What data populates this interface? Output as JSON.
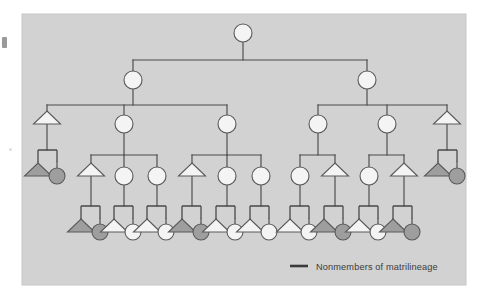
{
  "figure": {
    "type": "kinship-diagram",
    "title": "",
    "panel": {
      "background_color": "#d2d2d2",
      "border_color": "#c3c3c3",
      "x": 22,
      "y": 14,
      "width": 444,
      "height": 271
    },
    "line_color": "#4a4a4a",
    "shape_stroke_color": "#5a5a5a",
    "fill_member_color": "#f4f4f4",
    "fill_nonmember_color": "#9e9e9e",
    "symbol_legend": {
      "circle": "female",
      "triangle": "male",
      "square": "marriage-union-node"
    }
  },
  "legend": {
    "marker": "line-swatch",
    "label": "Nonmembers of matrilineage",
    "x": 290,
    "y": 266,
    "swatch": {
      "x1": 290,
      "x2": 308,
      "y": 266,
      "color": "#3a3a3a",
      "width": 2.6
    }
  },
  "chart_data": {
    "type": "diagram",
    "generations": 5,
    "nodes": [
      {
        "id": "g1-f1",
        "gen": 1,
        "shape": "circle",
        "fill": "member",
        "x": 243,
        "y": 33,
        "r": 9
      },
      {
        "id": "g2-f1",
        "gen": 2,
        "shape": "circle",
        "fill": "member",
        "x": 133,
        "y": 80,
        "r": 9
      },
      {
        "id": "g2-f2",
        "gen": 2,
        "shape": "circle",
        "fill": "member",
        "x": 367,
        "y": 80,
        "r": 9
      },
      {
        "id": "g3-m1",
        "gen": 3,
        "shape": "triangle",
        "fill": "member",
        "x": 47,
        "y": 124
      },
      {
        "id": "g3-f1",
        "gen": 3,
        "shape": "circle",
        "fill": "member",
        "x": 124,
        "y": 124,
        "r": 9
      },
      {
        "id": "g3-f2",
        "gen": 3,
        "shape": "circle",
        "fill": "member",
        "x": 227,
        "y": 124,
        "r": 9
      },
      {
        "id": "g3-f3",
        "gen": 3,
        "shape": "circle",
        "fill": "member",
        "x": 318,
        "y": 124,
        "r": 9
      },
      {
        "id": "g3-f4",
        "gen": 3,
        "shape": "circle",
        "fill": "member",
        "x": 387,
        "y": 124,
        "r": 9
      },
      {
        "id": "g3-m2",
        "gen": 3,
        "shape": "triangle",
        "fill": "member",
        "x": 447,
        "y": 124
      },
      {
        "id": "g4-sp1a",
        "gen": 4,
        "shape": "triangle",
        "fill": "nonmember",
        "x": 38,
        "y": 176
      },
      {
        "id": "g4-sp1b",
        "gen": 4,
        "shape": "circle",
        "fill": "nonmember",
        "x": 57,
        "y": 176,
        "r": 8
      },
      {
        "id": "g4-m1",
        "gen": 4,
        "shape": "triangle",
        "fill": "member",
        "x": 91,
        "y": 176
      },
      {
        "id": "g4-f1",
        "gen": 4,
        "shape": "circle",
        "fill": "member",
        "x": 124,
        "y": 176,
        "r": 9
      },
      {
        "id": "g4-f2",
        "gen": 4,
        "shape": "circle",
        "fill": "member",
        "x": 157,
        "y": 176,
        "r": 9
      },
      {
        "id": "g4-m2",
        "gen": 4,
        "shape": "triangle",
        "fill": "member",
        "x": 192,
        "y": 176
      },
      {
        "id": "g4-f3",
        "gen": 4,
        "shape": "circle",
        "fill": "member",
        "x": 227,
        "y": 176,
        "r": 9
      },
      {
        "id": "g4-f4",
        "gen": 4,
        "shape": "circle",
        "fill": "member",
        "x": 261,
        "y": 176,
        "r": 9
      },
      {
        "id": "g4-f5",
        "gen": 4,
        "shape": "circle",
        "fill": "member",
        "x": 300,
        "y": 176,
        "r": 9
      },
      {
        "id": "g4-m3",
        "gen": 4,
        "shape": "triangle",
        "fill": "member",
        "x": 335,
        "y": 176
      },
      {
        "id": "g4-f6",
        "gen": 4,
        "shape": "circle",
        "fill": "member",
        "x": 369,
        "y": 176,
        "r": 9
      },
      {
        "id": "g4-m4",
        "gen": 4,
        "shape": "triangle",
        "fill": "member",
        "x": 404,
        "y": 176
      },
      {
        "id": "g4-sp2a",
        "gen": 4,
        "shape": "triangle",
        "fill": "nonmember",
        "x": 438,
        "y": 176
      },
      {
        "id": "g4-sp2b",
        "gen": 4,
        "shape": "circle",
        "fill": "nonmember",
        "x": 457,
        "y": 176,
        "r": 8
      },
      {
        "id": "g5-p1t",
        "gen": 5,
        "shape": "triangle",
        "fill": "nonmember",
        "x": 81,
        "y": 232
      },
      {
        "id": "g5-p1c",
        "gen": 5,
        "shape": "circle",
        "fill": "nonmember",
        "x": 100,
        "y": 232,
        "r": 8
      },
      {
        "id": "g5-p2t",
        "gen": 5,
        "shape": "triangle",
        "fill": "member",
        "x": 114,
        "y": 232
      },
      {
        "id": "g5-p2c",
        "gen": 5,
        "shape": "circle",
        "fill": "member",
        "x": 133,
        "y": 232,
        "r": 8
      },
      {
        "id": "g5-p3t",
        "gen": 5,
        "shape": "triangle",
        "fill": "member",
        "x": 147,
        "y": 232
      },
      {
        "id": "g5-p3c",
        "gen": 5,
        "shape": "circle",
        "fill": "member",
        "x": 166,
        "y": 232,
        "r": 8
      },
      {
        "id": "g5-p4t",
        "gen": 5,
        "shape": "triangle",
        "fill": "nonmember",
        "x": 182,
        "y": 232
      },
      {
        "id": "g5-p4c",
        "gen": 5,
        "shape": "circle",
        "fill": "nonmember",
        "x": 201,
        "y": 232,
        "r": 8
      },
      {
        "id": "g5-p5t",
        "gen": 5,
        "shape": "triangle",
        "fill": "member",
        "x": 216,
        "y": 232
      },
      {
        "id": "g5-p5c",
        "gen": 5,
        "shape": "circle",
        "fill": "member",
        "x": 235,
        "y": 232,
        "r": 8
      },
      {
        "id": "g5-p6t",
        "gen": 5,
        "shape": "triangle",
        "fill": "member",
        "x": 250,
        "y": 232
      },
      {
        "id": "g5-p6c",
        "gen": 5,
        "shape": "circle",
        "fill": "member",
        "x": 269,
        "y": 232,
        "r": 8
      },
      {
        "id": "g5-p7t",
        "gen": 5,
        "shape": "triangle",
        "fill": "member",
        "x": 290,
        "y": 232
      },
      {
        "id": "g5-p7c",
        "gen": 5,
        "shape": "circle",
        "fill": "member",
        "x": 309,
        "y": 232,
        "r": 8
      },
      {
        "id": "g5-p8t",
        "gen": 5,
        "shape": "triangle",
        "fill": "nonmember",
        "x": 324,
        "y": 232
      },
      {
        "id": "g5-p8c",
        "gen": 5,
        "shape": "circle",
        "fill": "nonmember",
        "x": 343,
        "y": 232,
        "r": 8
      },
      {
        "id": "g5-p9t",
        "gen": 5,
        "shape": "triangle",
        "fill": "member",
        "x": 359,
        "y": 232
      },
      {
        "id": "g5-p9c",
        "gen": 5,
        "shape": "circle",
        "fill": "member",
        "x": 378,
        "y": 232,
        "r": 8
      },
      {
        "id": "g5-p10t",
        "gen": 5,
        "shape": "triangle",
        "fill": "nonmember",
        "x": 393,
        "y": 232
      },
      {
        "id": "g5-p10c",
        "gen": 5,
        "shape": "circle",
        "fill": "nonmember",
        "x": 412,
        "y": 232,
        "r": 8
      }
    ],
    "union_squares": [
      {
        "id": "u-left-top",
        "x": 38,
        "y": 150,
        "w": 19,
        "h": 12
      },
      {
        "id": "u-right-top",
        "x": 438,
        "y": 150,
        "w": 19,
        "h": 12
      },
      {
        "id": "u-b1",
        "x": 81,
        "y": 206,
        "w": 19,
        "h": 13
      },
      {
        "id": "u-b2",
        "x": 114,
        "y": 206,
        "w": 19,
        "h": 13
      },
      {
        "id": "u-b3",
        "x": 147,
        "y": 206,
        "w": 19,
        "h": 13
      },
      {
        "id": "u-b4",
        "x": 182,
        "y": 206,
        "w": 19,
        "h": 13
      },
      {
        "id": "u-b5",
        "x": 216,
        "y": 206,
        "w": 19,
        "h": 13
      },
      {
        "id": "u-b6",
        "x": 250,
        "y": 206,
        "w": 19,
        "h": 13
      },
      {
        "id": "u-b7",
        "x": 290,
        "y": 206,
        "w": 19,
        "h": 13
      },
      {
        "id": "u-b8",
        "x": 324,
        "y": 206,
        "w": 19,
        "h": 13
      },
      {
        "id": "u-b9",
        "x": 359,
        "y": 206,
        "w": 19,
        "h": 13
      },
      {
        "id": "u-b10",
        "x": 393,
        "y": 206,
        "w": 19,
        "h": 13
      }
    ],
    "sibling_bars": [
      {
        "id": "bar-g2",
        "y": 60,
        "x1": 133,
        "x2": 367,
        "stem_from": 243
      },
      {
        "id": "bar-g3-left",
        "y": 105,
        "x1": 47,
        "x2": 227,
        "stem_from": 133
      },
      {
        "id": "bar-g3-right",
        "y": 105,
        "x1": 318,
        "x2": 447,
        "stem_from": 367
      },
      {
        "id": "bar-g4-a",
        "y": 155,
        "x1": 91,
        "x2": 157,
        "stem_from": 124
      },
      {
        "id": "bar-g4-b",
        "y": 155,
        "x1": 192,
        "x2": 261,
        "stem_from": 227
      },
      {
        "id": "bar-g4-c",
        "y": 155,
        "x1": 300,
        "x2": 335,
        "stem_from": 318
      },
      {
        "id": "bar-g4-d",
        "y": 155,
        "x1": 369,
        "x2": 404,
        "stem_from": 387
      }
    ]
  }
}
